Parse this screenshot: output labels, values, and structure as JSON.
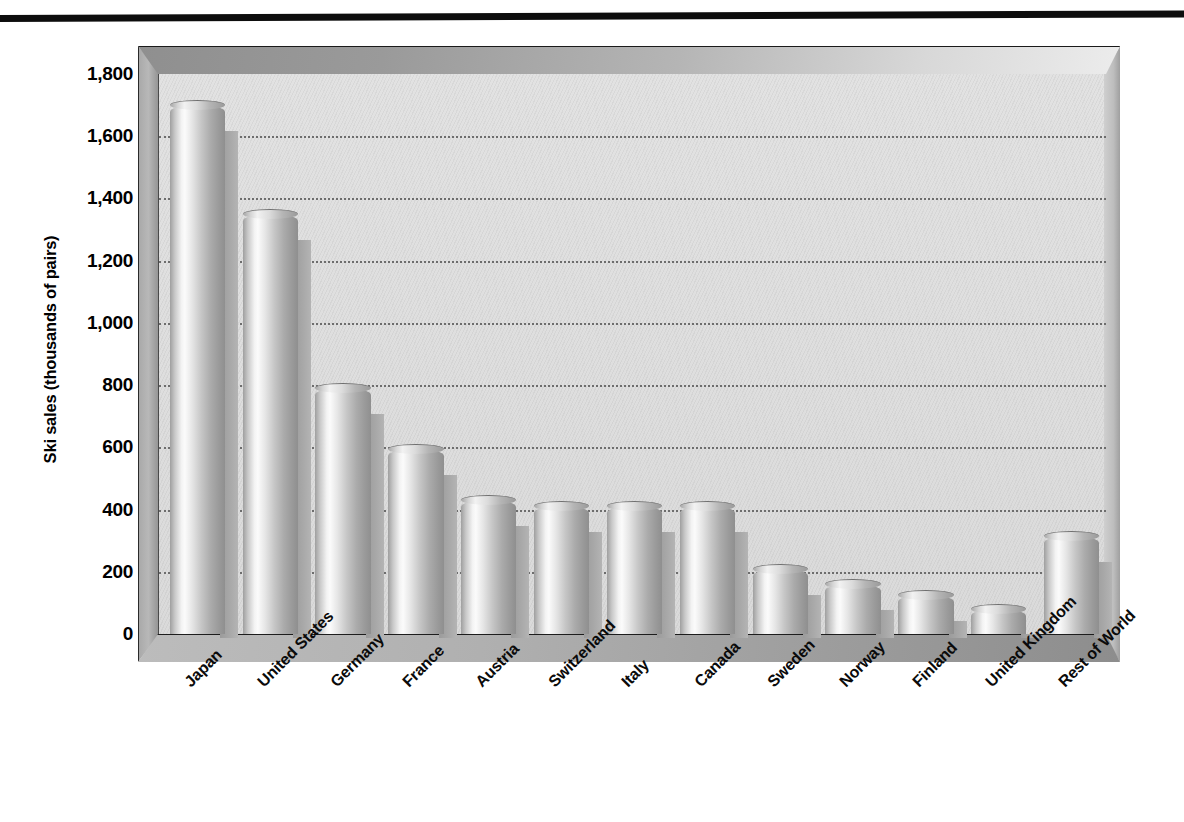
{
  "chart_data": {
    "type": "bar",
    "title": "",
    "xlabel": "",
    "ylabel": "Ski sales (thousands of pairs)",
    "categories": [
      "Japan",
      "United States",
      "Germany",
      "France",
      "Austria",
      "Switzerland",
      "Italy",
      "Canada",
      "Sweden",
      "Norway",
      "Finland",
      "United Kingdom",
      "Rest of World"
    ],
    "values": [
      1700,
      1350,
      790,
      595,
      430,
      410,
      410,
      410,
      210,
      160,
      125,
      80,
      315
    ],
    "ylim": [
      0,
      1800
    ],
    "ytick_labels": [
      "1,800",
      "1,600",
      "1,400",
      "1,200",
      "1,000",
      "800",
      "600",
      "400",
      "200",
      "0"
    ],
    "ytick_values": [
      1800,
      1600,
      1400,
      1200,
      1000,
      800,
      600,
      400,
      200,
      0
    ],
    "grid": true,
    "grid_style": "dotted-horizontal",
    "legend": "none",
    "style_3d": true,
    "bar_shape": "cylinder",
    "colors": {
      "bar_light": "#fbfbfb",
      "bar_mid": "#c6c6c6",
      "bar_dark": "#8f8f8f",
      "plot_background": "#dedede",
      "gridline": "#6d6d6d",
      "text": "#000000",
      "top_rule": "#0d0d0d"
    }
  }
}
